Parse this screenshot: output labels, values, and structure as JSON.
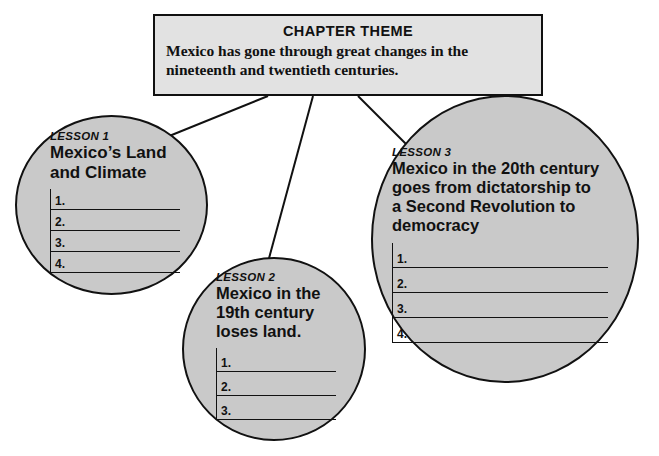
{
  "theme": {
    "heading": "CHAPTER THEME",
    "text": "Mexico has gone through great changes in the nineteenth and twentieth centuries."
  },
  "lessons": [
    {
      "label": "LESSON 1",
      "title": "Mexico’s Land and Climate",
      "title_lines": [
        "Mexico’s Land",
        "and Climate"
      ],
      "numbers": [
        "1.",
        "2.",
        "3.",
        "4."
      ]
    },
    {
      "label": "LESSON 2",
      "title": "Mexico in the 19th century loses land.",
      "title_lines": [
        "Mexico in the",
        "19th century",
        "loses land."
      ],
      "numbers": [
        "1.",
        "2.",
        "3."
      ]
    },
    {
      "label": "LESSON 3",
      "title": "Mexico in the 20th century goes from dictatorship to a Second Revolution to democracy",
      "title_lines": [
        "Mexico in the 20th century",
        "goes from dictatorship to",
        "a Second Revolution to",
        "democracy"
      ],
      "numbers": [
        "1.",
        "2.",
        "3.",
        "4."
      ]
    }
  ],
  "colors": {
    "circle_fill": "#c9c9c9",
    "box_fill": "#e2e2e2",
    "stroke": "#111111",
    "background": "#ffffff"
  }
}
